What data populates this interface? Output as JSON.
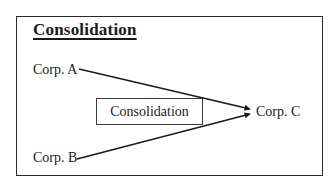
{
  "diagram": {
    "title": "Consolidation",
    "nodes": {
      "corp_a": "Corp. A",
      "corp_b": "Corp. B",
      "corp_c": "Corp. C"
    },
    "process_label": "Consolidation",
    "edges": [
      {
        "from": "Corp. A",
        "to": "Corp. C"
      },
      {
        "from": "Corp. B",
        "to": "Corp. C"
      }
    ],
    "colors": {
      "line": "#1a1a1a",
      "background": "#ffffff"
    }
  }
}
